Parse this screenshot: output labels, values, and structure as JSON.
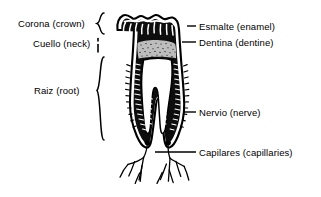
{
  "figure": {
    "kind": "tooth-anatomy-cross-section",
    "background_color": "#ffffff",
    "ink_color": "#000000",
    "pulp_fill_color": "#bdbdbd"
  },
  "labels_left": [
    {
      "id": "corona",
      "text": "Corona (crown)",
      "marker": "curly-brace"
    },
    {
      "id": "cuello",
      "text": "Cuello (neck)",
      "marker": "short-tick"
    },
    {
      "id": "raiz",
      "text": "Raiz (root)",
      "marker": "curly-brace-tall"
    }
  ],
  "labels_right": [
    {
      "id": "esmalte",
      "text": "Esmalte (enamel)",
      "marker": "leader-line"
    },
    {
      "id": "dentina",
      "text": "Dentina (dentine)",
      "marker": "leader-line"
    },
    {
      "id": "nervio",
      "text": "Nervio (nerve)",
      "marker": "leader-line"
    },
    {
      "id": "capilares",
      "text": "Capilares (capillaries)",
      "marker": "leader-line"
    }
  ]
}
